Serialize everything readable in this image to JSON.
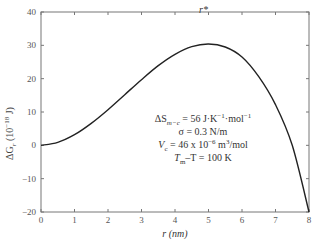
{
  "chart_data": {
    "type": "line",
    "title": "",
    "xlabel": "r (nm)",
    "ylabel": "ΔG_r (10^-18 J)",
    "xlim": [
      0,
      8
    ],
    "ylim": [
      -20,
      40
    ],
    "x_ticks": [
      0,
      1,
      2,
      3,
      4,
      5,
      6,
      7,
      8
    ],
    "y_ticks": [
      -20,
      -10,
      0,
      10,
      20,
      30,
      40
    ],
    "grid": false,
    "legend": null,
    "series": [
      {
        "name": "ΔG_r",
        "x": [
          0,
          0.5,
          1,
          1.5,
          2,
          2.5,
          3,
          3.5,
          4,
          4.5,
          5,
          5.5,
          6,
          6.5,
          7,
          7.5,
          8
        ],
        "values": [
          0,
          0.9,
          3.2,
          6.6,
          10.7,
          15.2,
          19.7,
          23.9,
          27.3,
          29.6,
          30.4,
          29.5,
          26.5,
          20.6,
          12.2,
          0.0,
          -20
        ]
      }
    ],
    "annotations": [
      {
        "text": "r*",
        "x": 5,
        "y": 30.4
      },
      {
        "text": "ΔS_m−c = 56 J·K^-1·mol^-1"
      },
      {
        "text": "σ = 0.3 N/m"
      },
      {
        "text": "V_c = 46 x 10^-6 m^3/mol"
      },
      {
        "text": "T_m−T = 100 K"
      }
    ]
  },
  "labels": {
    "x_axis": "r (nm)",
    "y_axis_main": "ΔG",
    "y_axis_sub": "r",
    "y_axis_unit_pre": " (10",
    "y_axis_exp": "−18",
    "y_axis_unit_post": " J)",
    "rstar": "r*"
  },
  "params": {
    "line1_pre": "ΔS",
    "line1_sub": "m−c",
    "line1_mid": " = 56 J·K",
    "line1_exp1": "−1",
    "line1_mid2": "·mol",
    "line1_exp2": "−1",
    "line2": "σ = 0.3 N/m",
    "line3_pre": "V",
    "line3_sub": "c",
    "line3_mid": " = 46 x 10",
    "line3_exp": "−6",
    "line3_mid2": " m",
    "line3_exp2": "3",
    "line3_post": "/mol",
    "line4_pre": "T",
    "line4_sub": "m",
    "line4_mid": "–T = 100 K"
  }
}
